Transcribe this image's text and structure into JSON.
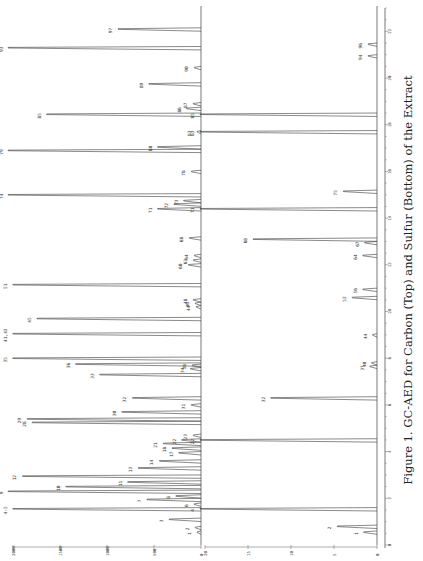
{
  "chart_data": {
    "type": "line",
    "title": "Figure 1. GC-AED for Carbon (Top) and Sulfur (Bottom) of the Extract",
    "orientation": "rotated-90-ccw",
    "xlabel": "Retention time (min)",
    "x_ticks": [
      0,
      2,
      4,
      6,
      8,
      10,
      12,
      14,
      16,
      18,
      20,
      22
    ],
    "xlim": [
      0,
      23
    ],
    "panels": [
      {
        "name": "Carbon",
        "position": "top",
        "ylabel": "",
        "y_ticks": [
          "0",
          "500",
          "1000",
          "1500",
          "2000"
        ],
        "ylim": [
          0,
          2000
        ],
        "peaks": [
          {
            "label": "1",
            "t": 0.55,
            "h": 40
          },
          {
            "label": "2",
            "t": 0.75,
            "h": 60
          },
          {
            "label": "3",
            "t": 1.1,
            "h": 330
          },
          {
            "label": "4-5",
            "t": 1.55,
            "h": 1950
          },
          {
            "label": "6",
            "t": 1.75,
            "h": 70
          },
          {
            "label": "7",
            "t": 1.95,
            "h": 560
          },
          {
            "label": "8",
            "t": 2.1,
            "h": 260
          },
          {
            "label": "9",
            "t": 2.3,
            "h": 2000
          },
          {
            "label": "10",
            "t": 2.5,
            "h": 1400
          },
          {
            "label": "11",
            "t": 2.7,
            "h": 760
          },
          {
            "label": "12",
            "t": 2.95,
            "h": 1850
          },
          {
            "label": "13",
            "t": 3.3,
            "h": 650
          },
          {
            "label": "14",
            "t": 3.6,
            "h": 430
          },
          {
            "label": "17",
            "t": 3.95,
            "h": 230
          },
          {
            "label": "18",
            "t": 4.15,
            "h": 300
          },
          {
            "label": "21",
            "t": 4.35,
            "h": 390
          },
          {
            "label": "22",
            "t": 4.5,
            "h": 200
          },
          {
            "label": "23",
            "t": 4.7,
            "h": 80
          },
          {
            "label": "28",
            "t": 5.25,
            "h": 1750
          },
          {
            "label": "29",
            "t": 5.4,
            "h": 1800
          },
          {
            "label": "30",
            "t": 5.7,
            "h": 820
          },
          {
            "label": "31",
            "t": 6.0,
            "h": 100
          },
          {
            "label": "32",
            "t": 6.3,
            "h": 710
          },
          {
            "label": "33",
            "t": 7.3,
            "h": 1050
          },
          {
            "label": "34",
            "t": 7.55,
            "h": 110
          },
          {
            "label": "35",
            "t": 8.0,
            "h": 1950
          },
          {
            "label": "36",
            "t": 7.75,
            "h": 1300
          },
          {
            "label": "38",
            "t": 7.7,
            "h": 90
          },
          {
            "label": "41,43",
            "t": 9.05,
            "h": 1950
          },
          {
            "label": "45",
            "t": 9.7,
            "h": 1700
          },
          {
            "label": "46",
            "t": 10.35,
            "h": 60
          },
          {
            "label": "44",
            "t": 10.2,
            "h": 50
          },
          {
            "label": "48",
            "t": 10.5,
            "h": 80
          },
          {
            "label": "51",
            "t": 11.15,
            "h": 1950
          },
          {
            "label": "60",
            "t": 12.0,
            "h": 130
          },
          {
            "label": "63",
            "t": 12.2,
            "h": 80
          },
          {
            "label": "64",
            "t": 12.4,
            "h": 70
          },
          {
            "label": "68",
            "t": 13.15,
            "h": 120
          },
          {
            "label": "71",
            "t": 14.4,
            "h": 450
          },
          {
            "label": "72",
            "t": 14.6,
            "h": 280
          },
          {
            "label": "73",
            "t": 14.75,
            "h": 180
          },
          {
            "label": "74",
            "t": 15.0,
            "h": 2000
          },
          {
            "label": "78",
            "t": 16.0,
            "h": 100
          },
          {
            "label": "79",
            "t": 16.9,
            "h": 2000
          },
          {
            "label": "80",
            "t": 17.05,
            "h": 450
          },
          {
            "label": "83",
            "t": 17.7,
            "h": 40
          },
          {
            "label": "85",
            "t": 18.45,
            "h": 1600
          },
          {
            "label": "86",
            "t": 18.7,
            "h": 150
          },
          {
            "label": "87",
            "t": 18.9,
            "h": 80
          },
          {
            "label": "89",
            "t": 19.75,
            "h": 540
          },
          {
            "label": "90",
            "t": 20.45,
            "h": 70
          },
          {
            "label": "93",
            "t": 21.3,
            "h": 2000
          },
          {
            "label": "97",
            "t": 22.1,
            "h": 860
          }
        ]
      },
      {
        "name": "Sulfur",
        "position": "bottom",
        "ylabel": "",
        "y_ticks": [
          "0",
          "5",
          "10",
          "15",
          "20"
        ],
        "ylim": [
          0,
          20
        ],
        "peaks": [
          {
            "label": "1",
            "t": 0.55,
            "h": 1.5
          },
          {
            "label": "2",
            "t": 0.8,
            "h": 4.5
          },
          {
            "label": "4",
            "t": 1.55,
            "h": 20
          },
          {
            "label": "22",
            "t": 4.5,
            "h": 20
          },
          {
            "label": "32",
            "t": 6.3,
            "h": 12
          },
          {
            "label": "37",
            "t": 7.65,
            "h": 0.8
          },
          {
            "label": "40",
            "t": 7.8,
            "h": 0.6
          },
          {
            "label": "44",
            "t": 9.0,
            "h": 0.5
          },
          {
            "label": "52",
            "t": 10.6,
            "h": 2.8
          },
          {
            "label": "56",
            "t": 10.95,
            "h": 1.6
          },
          {
            "label": "64",
            "t": 12.4,
            "h": 1.6
          },
          {
            "label": "67",
            "t": 12.95,
            "h": 1.4
          },
          {
            "label": "68",
            "t": 13.1,
            "h": 14
          },
          {
            "label": "71",
            "t": 14.4,
            "h": 20
          },
          {
            "label": "75",
            "t": 15.15,
            "h": 3.8
          },
          {
            "label": "83",
            "t": 17.7,
            "h": 20
          },
          {
            "label": "85",
            "t": 18.45,
            "h": 20
          },
          {
            "label": "94",
            "t": 20.95,
            "h": 1.0
          },
          {
            "label": "96",
            "t": 21.45,
            "h": 1.0
          }
        ]
      }
    ]
  },
  "caption": "Figure 1. GC-AED for Carbon (Top) and Sulfur (Bottom) of the Extract"
}
